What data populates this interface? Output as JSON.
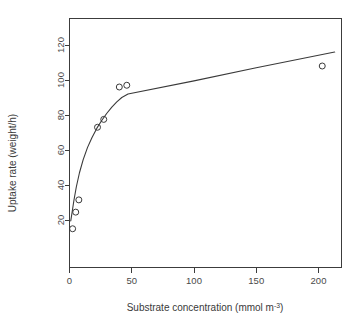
{
  "chart_data": {
    "type": "scatter",
    "title": "",
    "xlabel": "Substrate concentration (mmol m-3)",
    "xlabel_main": "Substrate concentration (mmol m",
    "xlabel_exponent": "-3",
    "xlabel_tail": ")",
    "ylabel": "Uptake rate (weight/h)",
    "xlim": [
      -8,
      218
    ],
    "ylim": [
      11,
      131
    ],
    "grid": false,
    "legend": null,
    "xticks": [
      0,
      50,
      100,
      150,
      200
    ],
    "xticklabels": [
      "0",
      "50",
      "100",
      "150",
      "200"
    ],
    "yticks": [
      20,
      40,
      60,
      80,
      100,
      120
    ],
    "yticklabels": [
      "20",
      "40",
      "60",
      "80",
      "100",
      "120"
    ],
    "marker": "open-circle",
    "series": [
      {
        "name": "observed uptake",
        "marker": "open-circle",
        "x": [
          2.5,
          5.0,
          7.5,
          22.5,
          27.5,
          40.0,
          46.0,
          203.0
        ],
        "y": [
          15.0,
          24.5,
          31.5,
          73.0,
          77.5,
          96.0,
          97.0,
          108.0
        ],
        "points": [
          {
            "x": 2.5,
            "y": 15.0
          },
          {
            "x": 5.0,
            "y": 24.5
          },
          {
            "x": 7.5,
            "y": 31.5
          },
          {
            "x": 22.5,
            "y": 73.0
          },
          {
            "x": 27.5,
            "y": 77.5
          },
          {
            "x": 40.0,
            "y": 96.0
          },
          {
            "x": 46.0,
            "y": 97.0
          },
          {
            "x": 203.0,
            "y": 108.0
          }
        ]
      },
      {
        "name": "fitted curve",
        "marker": "none",
        "line": true,
        "points": [
          {
            "x": 1.0,
            "y": 19.5
          },
          {
            "x": 2.0,
            "y": 24.0
          },
          {
            "x": 3.5,
            "y": 31.0
          },
          {
            "x": 5.5,
            "y": 39.0
          },
          {
            "x": 8.0,
            "y": 47.0
          },
          {
            "x": 11.0,
            "y": 54.5
          },
          {
            "x": 14.5,
            "y": 61.5
          },
          {
            "x": 18.0,
            "y": 67.0
          },
          {
            "x": 22.0,
            "y": 72.5
          },
          {
            "x": 26.0,
            "y": 77.0
          },
          {
            "x": 30.0,
            "y": 81.0
          },
          {
            "x": 34.0,
            "y": 84.5
          },
          {
            "x": 38.0,
            "y": 87.5
          },
          {
            "x": 42.0,
            "y": 90.0
          },
          {
            "x": 47.0,
            "y": 92.0
          },
          {
            "x": 100.0,
            "y": 99.5
          },
          {
            "x": 150.0,
            "y": 107.0
          },
          {
            "x": 213.0,
            "y": 116.0
          }
        ]
      }
    ]
  },
  "figure": {
    "background_color": "#ffffff",
    "foreground_color": "#3a3a3a",
    "point_radius": 3
  }
}
